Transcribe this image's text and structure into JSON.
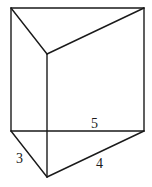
{
  "diagram": {
    "labels": {
      "hypotenuse": "5",
      "short_leg": "3",
      "long_leg": "4"
    },
    "stroke_color": "#1a1a1a",
    "background": "#ffffff"
  }
}
